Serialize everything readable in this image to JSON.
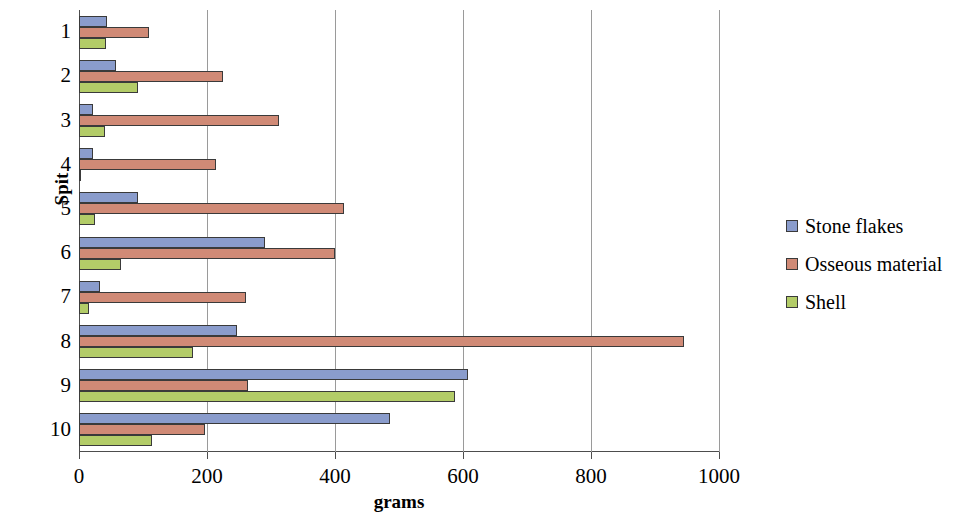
{
  "chart_data": {
    "type": "bar",
    "orientation": "horizontal",
    "title": "",
    "xlabel": "grams",
    "ylabel": "Spit",
    "categories": [
      "1",
      "2",
      "3",
      "4",
      "5",
      "6",
      "7",
      "8",
      "9",
      "10"
    ],
    "xlim": [
      0,
      1000
    ],
    "xticks": [
      0,
      200,
      400,
      600,
      800,
      1000
    ],
    "xtick_labels": [
      "0",
      "200",
      "400",
      "600",
      "800",
      "1000"
    ],
    "grid": "vertical",
    "legend_position": "right",
    "series": [
      {
        "name": "Stone flakes",
        "color": "#8a9ccc",
        "values": [
          44,
          58,
          22,
          22,
          92,
          291,
          33,
          247,
          608,
          486
        ]
      },
      {
        "name": "Osseous material",
        "color": "#d08a76",
        "values": [
          109,
          225,
          313,
          214,
          414,
          400,
          261,
          945,
          264,
          197
        ]
      },
      {
        "name": "Shell",
        "color": "#b3cc68",
        "values": [
          42,
          92,
          41,
          3,
          25,
          66,
          15,
          178,
          588,
          114
        ]
      }
    ]
  }
}
